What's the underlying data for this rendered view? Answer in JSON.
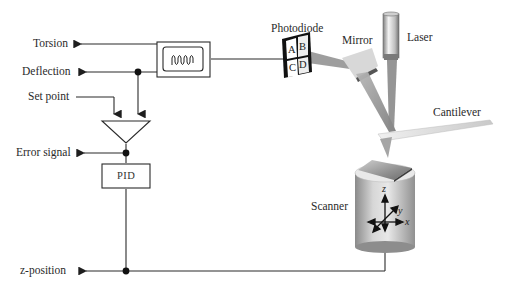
{
  "diagram": {
    "outputs": [
      {
        "id": "torsion",
        "label": "Torsion"
      },
      {
        "id": "deflection",
        "label": "Deflection"
      },
      {
        "id": "error_signal",
        "label": "Error signal"
      },
      {
        "id": "z_position",
        "label": "z-position"
      }
    ],
    "inputs": [
      {
        "id": "set_point",
        "label": "Set point"
      }
    ],
    "blocks": {
      "oscilloscope": {
        "label": "",
        "icon": "waveform-icon"
      },
      "comparator": {
        "label": "",
        "shape": "triangle"
      },
      "pid": {
        "label": "PID"
      }
    },
    "components": {
      "photodiode": {
        "label": "Photodiode",
        "quadrants": [
          "A",
          "B",
          "C",
          "D"
        ]
      },
      "mirror": {
        "label": "Mirror"
      },
      "laser": {
        "label": "Laser"
      },
      "cantilever": {
        "label": "Cantilever"
      },
      "scanner": {
        "label": "Scanner",
        "axes": {
          "x": "x",
          "y": "y",
          "z": "z"
        }
      }
    },
    "colors": {
      "line": "#2b2b2b",
      "beam": "#9a9a9a",
      "metal_light": "#e6e6e6",
      "metal_dark": "#8c8c8c",
      "background": "#ffffff"
    }
  }
}
